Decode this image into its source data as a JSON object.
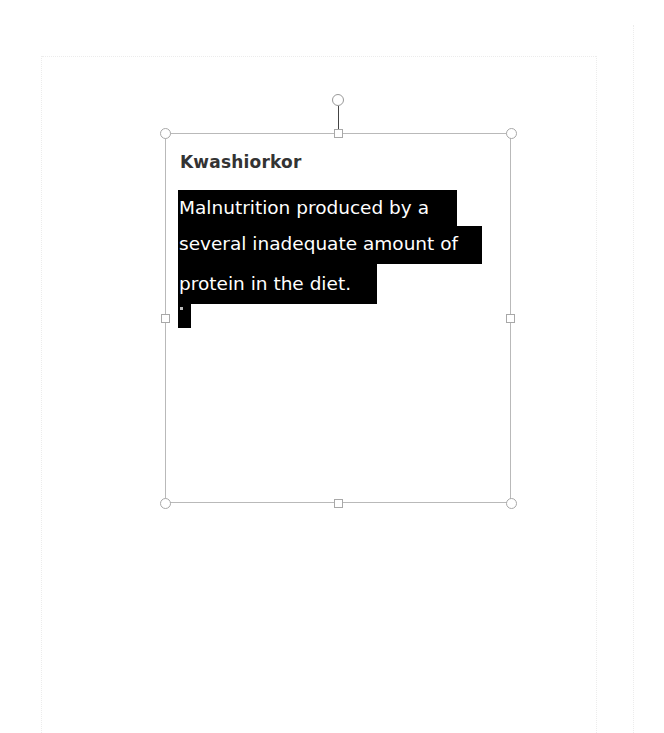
{
  "document": {
    "textbox": {
      "title": "Kwashiorkor",
      "selected_lines": [
        "Malnutrition produced by a",
        "several inadequate amount of",
        "protein in the diet."
      ]
    }
  },
  "colors": {
    "selection_background": "#000000",
    "selection_text": "#ffffff",
    "title_text": "#333333",
    "frame_border": "#b9b9b9"
  }
}
